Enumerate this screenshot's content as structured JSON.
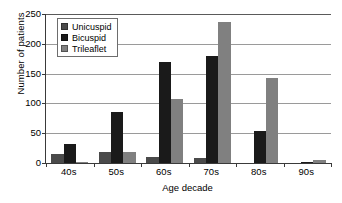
{
  "chart_data": {
    "type": "bar",
    "title": "",
    "subtitle": "",
    "xlabel": "Age decade",
    "ylabel": "Number of patients",
    "categories": [
      "40s",
      "50s",
      "60s",
      "70s",
      "80s",
      "90s"
    ],
    "series": [
      {
        "name": "Unicuspid",
        "color": "#4a4a4a",
        "values": [
          15,
          18,
          10,
          8,
          0,
          0
        ]
      },
      {
        "name": "Bicuspid",
        "color": "#1a1a1a",
        "values": [
          32,
          86,
          170,
          180,
          54,
          2
        ]
      },
      {
        "name": "Trileaflet",
        "color": "#808080",
        "values": [
          1,
          18,
          108,
          236,
          143,
          5
        ]
      }
    ],
    "ylim": [
      0,
      250
    ],
    "ytick_labels": [
      "0",
      "50",
      "100",
      "150",
      "200",
      "250"
    ],
    "ytick_values": [
      0,
      50,
      100,
      150,
      200,
      250
    ],
    "grid": true,
    "grid_axis": "y",
    "legend_position": "upper-left-inside",
    "legend_entries": [
      "Unicuspid",
      "Bicuspid",
      "Trileaflet"
    ],
    "annotations": []
  },
  "axes": {
    "y_title": "Number of patients",
    "x_title": "Age decade"
  },
  "legend": {
    "items": [
      {
        "label": "Unicuspid"
      },
      {
        "label": "Bicuspid"
      },
      {
        "label": "Trileaflet"
      }
    ]
  },
  "colors": {
    "unicuspid": "#4a4a4a",
    "bicuspid": "#1a1a1a",
    "trileaflet": "#808080",
    "axis": "#3a3a3a",
    "gridline": "#9a9a9a",
    "background": "#ffffff",
    "text": "#000000"
  }
}
